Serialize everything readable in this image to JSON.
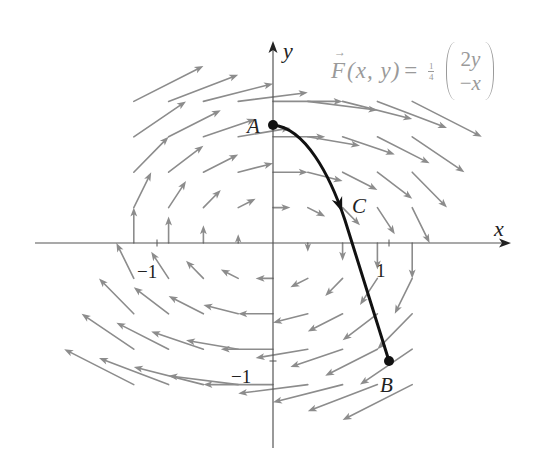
{
  "figure": {
    "formula": {
      "symbol": "F",
      "vector_arrow": "→",
      "args": "(x, y)",
      "equals": "=",
      "coefficient": {
        "numerator": "1",
        "denominator": "4"
      },
      "vector": {
        "top": {
          "coef": "2",
          "var": "y"
        },
        "bottom": {
          "sign": "−",
          "var": "x"
        }
      }
    },
    "axes": {
      "x": {
        "label": "x",
        "ticks": [
          {
            "value": -1,
            "label": "−1"
          },
          {
            "value": 1,
            "label": "1"
          }
        ]
      },
      "y": {
        "label": "y",
        "ticks": [
          {
            "value": 1,
            "label": ""
          },
          {
            "value": -1,
            "label": "−1"
          }
        ]
      },
      "color": "#555555"
    },
    "mapping": {
      "origin_px": [
        273,
        243
      ],
      "unit_px": [
        116,
        118
      ]
    },
    "vector_field": {
      "expression": "F(x, y) = 1/4 (2y, −x)",
      "coefficient": 0.25,
      "matrix": [
        [
          0,
          2
        ],
        [
          -1,
          0
        ]
      ],
      "grid": {
        "x_min": -1.2,
        "x_max": 1.2,
        "y_min": -1.2,
        "y_max": 1.2,
        "step": 0.3
      },
      "arrow_scale": 1,
      "color": "#8c8c8c"
    },
    "points": {
      "A": {
        "label": "A",
        "coords": [
          0,
          1
        ],
        "marker": true
      },
      "B": {
        "label": "B",
        "coords": [
          1,
          -1
        ],
        "marker": true
      },
      "C": {
        "label": "C",
        "coords": [
          0.58,
          0.31
        ],
        "marker": false
      }
    },
    "curve": {
      "from": "A",
      "to": "B",
      "start": [
        0,
        1
      ],
      "segments": [
        {
          "type": "C",
          "points": [
            [
              0.276,
              0.975
            ],
            [
              0.491,
              0.576
            ],
            [
              0.62,
              0.195
            ]
          ]
        },
        {
          "type": "L",
          "points": [
            [
              1,
              -1
            ]
          ]
        }
      ],
      "direction_arrow": {
        "segment": 0,
        "t": 0.9
      },
      "color": "#111111"
    }
  }
}
